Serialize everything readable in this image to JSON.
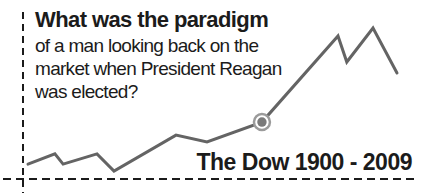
{
  "question": {
    "headline": "What was the paradigm",
    "lines": [
      "of a man looking back on the",
      "market when President Reagan",
      "was elected?"
    ]
  },
  "chart_data": {
    "type": "line",
    "title": "The Dow 1900 - 2009",
    "xlabel": "",
    "ylabel": "",
    "x_range_years": [
      1900,
      2009
    ],
    "axis_style": "hand-drawn dashed L axes, no ticks, no gridlines",
    "legend": "none",
    "series": [
      {
        "name": "The Dow (stylized)",
        "points": [
          {
            "x_pct": 0.0,
            "y_pct": 9.9
          },
          {
            "x_pct": 7.3,
            "y_pct": 16.6
          },
          {
            "x_pct": 9.5,
            "y_pct": 9.9
          },
          {
            "x_pct": 18.7,
            "y_pct": 16.6
          },
          {
            "x_pct": 23.3,
            "y_pct": 5.3
          },
          {
            "x_pct": 40.1,
            "y_pct": 29.1
          },
          {
            "x_pct": 48.5,
            "y_pct": 24.5
          },
          {
            "x_pct": 63.4,
            "y_pct": 37.7
          },
          {
            "x_pct": 84.0,
            "y_pct": 94.7
          },
          {
            "x_pct": 86.4,
            "y_pct": 77.5
          },
          {
            "x_pct": 93.5,
            "y_pct": 100.0
          },
          {
            "x_pct": 100.0,
            "y_pct": 70.2
          }
        ]
      }
    ],
    "highlight_index": 7
  },
  "colors": {
    "background": "#ffffff",
    "text": "#1b1b1b",
    "axis": "#1b1b1b",
    "line": "#646464",
    "marker_fill": "#7a7a7a",
    "marker_ring": "#9b9b9b"
  }
}
